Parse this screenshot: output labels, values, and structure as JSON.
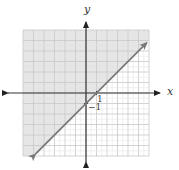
{
  "chart_data": {
    "type": "line",
    "title": "",
    "xlabel": "x",
    "ylabel": "y",
    "xlim": [
      -6,
      6
    ],
    "ylim": [
      -6,
      6
    ],
    "grid": true,
    "tick_labels": [
      {
        "axis": "x",
        "value": 1,
        "label": "1"
      },
      {
        "axis": "y",
        "value": -1,
        "label": "−1"
      }
    ],
    "series": [
      {
        "name": "boundary y = x - 1",
        "style": "solid",
        "arrows": "both",
        "x": [
          -4.8,
          0,
          1,
          5.8
        ],
        "y": [
          -5.8,
          -1,
          0,
          4.8
        ]
      }
    ],
    "shaded_region": {
      "inequality": "y >= x - 1",
      "side": "above-left",
      "color": "#e6e6e6"
    },
    "colors": {
      "grid": "#c8c8c8",
      "axis": "#333333",
      "line": "#7a7a7a",
      "shade": "#e6e6e6"
    }
  },
  "labels": {
    "x_axis": "x",
    "y_axis": "y",
    "x_tick": "1",
    "y_tick": "−1"
  }
}
